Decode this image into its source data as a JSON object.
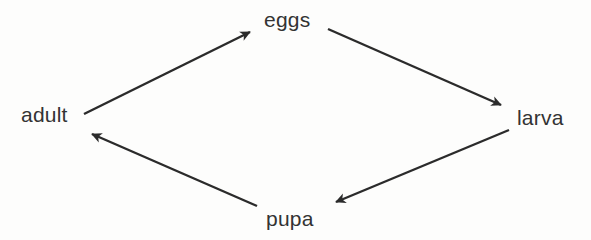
{
  "diagram": {
    "type": "cycle",
    "background_color": "#fdfdfc",
    "line_color": "#2b2b2b",
    "text_color": "#333333",
    "nodes": [
      {
        "id": "eggs",
        "label": "eggs",
        "x": 288,
        "y": 19,
        "position": "top"
      },
      {
        "id": "larva",
        "label": "larva",
        "x": 543,
        "y": 117,
        "position": "right"
      },
      {
        "id": "pupa",
        "label": "pupa",
        "x": 292,
        "y": 219,
        "position": "bottom"
      },
      {
        "id": "adult",
        "label": "adult",
        "x": 50,
        "y": 114,
        "position": "left"
      }
    ],
    "edges": [
      {
        "id": "adult-to-eggs",
        "from": "adult",
        "to": "eggs",
        "x1": 84,
        "y1": 114,
        "x2": 257,
        "y2": 29,
        "arrowhead": "end"
      },
      {
        "id": "eggs-to-larva",
        "from": "eggs",
        "to": "larva",
        "x1": 328,
        "y1": 29,
        "x2": 508,
        "y2": 108,
        "arrowhead": "end"
      },
      {
        "id": "larva-to-pupa",
        "from": "larva",
        "to": "pupa",
        "x1": 509,
        "y1": 130,
        "x2": 329,
        "y2": 205,
        "arrowhead": "end"
      },
      {
        "id": "pupa-to-adult",
        "from": "pupa",
        "to": "adult",
        "x1": 257,
        "y1": 206,
        "x2": 85,
        "y2": 131,
        "arrowhead": "end"
      }
    ]
  }
}
